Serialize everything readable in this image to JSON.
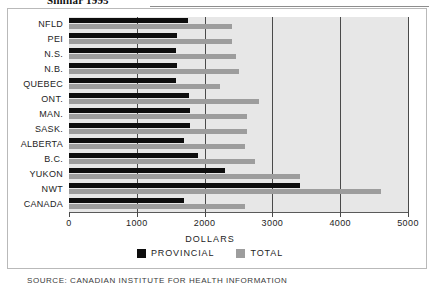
{
  "title": "Similar 1995",
  "source": "SOURCE: CANADIAN INSTITUTE FOR HEALTH INFORMATION",
  "legend": {
    "position": "bottom",
    "entries": [
      {
        "label": "PROVINCIAL",
        "color": "#0d0d0d"
      },
      {
        "label": "TOTAL",
        "color": "#9d9d9d"
      }
    ]
  },
  "colors": {
    "provincial": "#0d0d0d",
    "total": "#9d9d9d",
    "plot_background": "#e7e7e7",
    "gridline": "#4a4a4a",
    "frame": "#b9b9b9"
  },
  "chart_data": {
    "type": "bar",
    "orientation": "horizontal",
    "title": "Similar 1995",
    "xlabel": "DOLLARS",
    "ylabel": "",
    "xlim": [
      0,
      5000
    ],
    "xticks": [
      0,
      1000,
      2000,
      3000,
      4000,
      5000
    ],
    "xticklabels": [
      "0",
      "1000",
      "2000",
      "3000",
      "4000",
      "5000"
    ],
    "grid": true,
    "categories": [
      "NFLD",
      "PEI",
      "N.S.",
      "N.B.",
      "QUEBEC",
      "ONT.",
      "MAN.",
      "SASK.",
      "ALBERTA",
      "B.C.",
      "YUKON",
      "NWT",
      "CANADA"
    ],
    "series": [
      {
        "name": "PROVINCIAL",
        "color": "#0d0d0d",
        "values": [
          1750,
          1600,
          1580,
          1600,
          1580,
          1770,
          1780,
          1790,
          1700,
          1900,
          2300,
          3400,
          1700
        ]
      },
      {
        "name": "TOTAL",
        "color": "#9d9d9d",
        "values": [
          2400,
          2400,
          2470,
          2500,
          2230,
          2800,
          2620,
          2620,
          2600,
          2750,
          3400,
          4600,
          2600
        ]
      }
    ]
  }
}
